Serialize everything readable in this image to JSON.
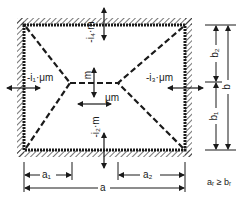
{
  "diagram": {
    "type": "yield-line pattern of rectangular slab clamped on four edges",
    "colors": {
      "line": "#1a1a1a",
      "background": "#ffffff"
    },
    "moment_labels": {
      "top_edge": "-i₄·m",
      "left_edge": "-i₁·μm",
      "right_edge": "-i₃·μm",
      "bottom_edge": "-i₂·m",
      "center_vertical": "m",
      "center_horizontal": "μm"
    },
    "dimensions": {
      "a1": "a₁",
      "a2": "a₂",
      "a": "a",
      "b1": "b₁",
      "b2": "b₂",
      "b": "b"
    },
    "condition": "aᵣ ≥ bᵣ"
  }
}
